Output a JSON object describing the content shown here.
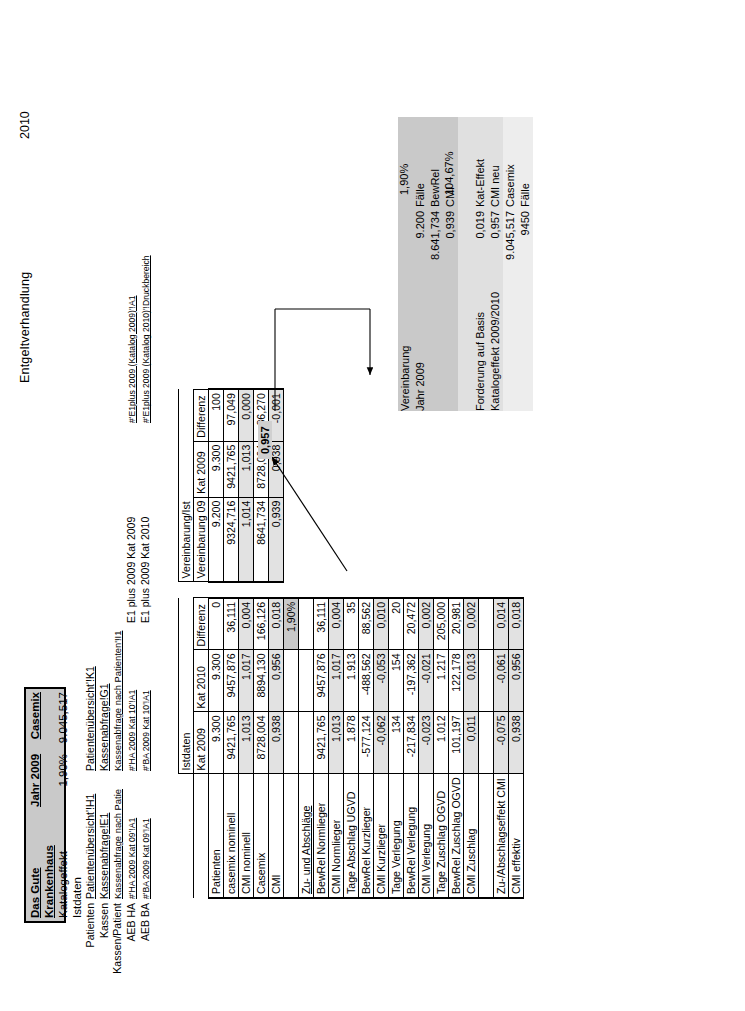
{
  "document": {
    "title": "Entgeltverhandlung",
    "year": "2010"
  },
  "header_box": {
    "hospital": "Das Gute Krankenhaus",
    "col2_title": "Jahr 2009",
    "col3_title": "Casemix",
    "row_label": "Katalogeffekt Istdaten",
    "percent": "1,90%",
    "casemix": "9.045,517"
  },
  "links": {
    "rows": [
      {
        "label": "Patienten",
        "a": "Patientenübersicht'!H1",
        "b": "Patientenübersicht'!K1",
        "c": ""
      },
      {
        "label": "Kassen",
        "a": "Kassenabfrage!E1",
        "b": "Kassenabfrage!G1",
        "c": ""
      },
      {
        "label": "Kassen/Patient",
        "a": "Kassenabfrage nach Patie",
        "b": "Kassenabfrage nach Patienten'!I1",
        "c": ""
      },
      {
        "label": "AEB HA",
        "a": "#'HA 2009 Kat 09'!A1",
        "b": "#'HA 2009 Kat 10'!A1",
        "c": "E1 plus 2009 Kat 2009",
        "d": "#'E1plus 2009 (Katalog 2009)'!A1"
      },
      {
        "label": "AEB BA",
        "a": "#'BA 2009 Kat 09'!A1",
        "b": "#'BA 2009 Kat 10'!A1",
        "c": "E1 plus 2009 Kat 2010",
        "d": "#'E1plus 2009 (Katalog 2010)'!Druckbereich"
      }
    ]
  },
  "table": {
    "group_headers": {
      "istdaten": "Istdaten",
      "vereinbarung_ist": "Vereinbarung/Ist"
    },
    "columns": [
      "",
      "Kat 2009",
      "Kat 2010",
      "Differenz",
      "Vereinbarung 09",
      "Kat 2009",
      "Differenz"
    ],
    "rows": [
      {
        "label": "Patienten",
        "kat2009": "9.300",
        "kat2010": "9.300",
        "differenz": "0",
        "vereinbarung09": "9.200",
        "v_kat2009": "9.300",
        "v_differenz": "100",
        "shade": false
      },
      {
        "label": "casemix nominell",
        "kat2009": "9421,765",
        "kat2010": "9457,876",
        "differenz": "36,111",
        "vereinbarung09": "9324,716",
        "v_kat2009": "9421,765",
        "v_differenz": "97,049",
        "shade": false
      },
      {
        "label": "CMI nominell",
        "kat2009": "1,013",
        "kat2010": "1,017",
        "differenz": "0,004",
        "vereinbarung09": "1,014",
        "v_kat2009": "1,013",
        "v_differenz": "0,000",
        "shade": true
      },
      {
        "label": "Casemix",
        "kat2009": "8728,004",
        "kat2010": "8894,130",
        "differenz": "166,126",
        "vereinbarung09": "8641,734",
        "v_kat2009": "8728,004",
        "v_differenz": "86,270",
        "shade": false
      },
      {
        "label": "CMI",
        "kat2009": "0,938",
        "kat2010": "0,956",
        "differenz": "0,018",
        "vereinbarung09": "0,939",
        "v_kat2009": "0,938",
        "v_differenz": "-0,001",
        "shade": true
      },
      {
        "label": "",
        "kat2009": "",
        "kat2010": "",
        "differenz": "1,90%",
        "vereinbarung09": "",
        "v_kat2009": "",
        "v_differenz": "",
        "shade": false,
        "diffShade": true,
        "diffBold": true
      },
      {
        "label": "Zu- und Abschläge",
        "kat2009": "",
        "kat2010": "",
        "differenz": "",
        "vereinbarung09": "",
        "v_kat2009": "",
        "v_differenz": "",
        "section": true
      },
      {
        "label": "BewRel Normlieger",
        "kat2009": "9421,765",
        "kat2010": "9457,876",
        "differenz": "36,111",
        "vereinbarung09": "",
        "v_kat2009": "",
        "v_differenz": "",
        "shade": false
      },
      {
        "label": "CMI Normlieger",
        "kat2009": "1,013",
        "kat2010": "1,017",
        "differenz": "0,004",
        "vereinbarung09": "",
        "v_kat2009": "",
        "v_differenz": "",
        "shade": true
      },
      {
        "label": "Tage Abschlag UGVD",
        "kat2009": "1.878",
        "kat2010": "1.913",
        "differenz": "35",
        "vereinbarung09": "",
        "v_kat2009": "",
        "v_differenz": "",
        "shade": false
      },
      {
        "label": "BewRel Kurzlieger",
        "kat2009": "-577,124",
        "kat2010": "-488,562",
        "differenz": "88,562",
        "vereinbarung09": "",
        "v_kat2009": "",
        "v_differenz": "",
        "shade": false
      },
      {
        "label": "CMI Kurzlieger",
        "kat2009": "-0,062",
        "kat2010": "-0,053",
        "differenz": "0,010",
        "vereinbarung09": "",
        "v_kat2009": "",
        "v_differenz": "",
        "shade": true
      },
      {
        "label": "Tage Verlegung",
        "kat2009": "134",
        "kat2010": "154",
        "differenz": "20",
        "vereinbarung09": "",
        "v_kat2009": "",
        "v_differenz": "",
        "shade": false
      },
      {
        "label": "BewRel Verlegung",
        "kat2009": "-217,834",
        "kat2010": "-197,362",
        "differenz": "20,472",
        "vereinbarung09": "",
        "v_kat2009": "",
        "v_differenz": "",
        "shade": false
      },
      {
        "label": "CMI Verlegung",
        "kat2009": "-0,023",
        "kat2010": "-0,021",
        "differenz": "0,002",
        "vereinbarung09": "",
        "v_kat2009": "",
        "v_differenz": "",
        "shade": true
      },
      {
        "label": "Tage Zuschlag OGVD",
        "kat2009": "1.012",
        "kat2010": "1.217",
        "differenz": "205,000",
        "vereinbarung09": "",
        "v_kat2009": "",
        "v_differenz": "",
        "shade": false
      },
      {
        "label": "BewRel Zuschlag OGVD",
        "kat2009": "101,197",
        "kat2010": "122,178",
        "differenz": "20,981",
        "vereinbarung09": "",
        "v_kat2009": "",
        "v_differenz": "",
        "shade": false
      },
      {
        "label": "CMI Zuschlag",
        "kat2009": "0,011",
        "kat2010": "0,013",
        "differenz": "0,002",
        "vereinbarung09": "",
        "v_kat2009": "",
        "v_differenz": "",
        "shade": true
      },
      {
        "label": "",
        "kat2009": "",
        "kat2010": "",
        "differenz": "",
        "vereinbarung09": "",
        "v_kat2009": "",
        "v_differenz": "",
        "shade": false
      },
      {
        "label": "Zu-/Abschlagseffekt CMI",
        "kat2009": "-0,075",
        "kat2010": "-0,061",
        "differenz": "0,014",
        "vereinbarung09": "",
        "v_kat2009": "",
        "v_differenz": "",
        "shade": true
      },
      {
        "label": "CMI effektiv",
        "kat2009": "0,938",
        "kat2010": "0,956",
        "differenz": "0,018",
        "vereinbarung09": "",
        "v_kat2009": "",
        "v_differenz": "",
        "shade": true
      }
    ]
  },
  "callout": {
    "value": "0,957"
  },
  "summary": {
    "rows": [
      {
        "label": "Vereinbarung",
        "value": "",
        "unit": "",
        "bg": "bg1"
      },
      {
        "label": "Jahr 2009",
        "value": "9.200",
        "unit": "Fälle",
        "bg": "bg1"
      },
      {
        "label": "",
        "value": "8.641,734",
        "unit": "BewRel",
        "bg": "bg1"
      },
      {
        "label": "",
        "value": "0,939",
        "unit": "CMI",
        "bg": "bg1"
      },
      {
        "label": "",
        "value": "",
        "unit": "",
        "bg": "bg2"
      },
      {
        "label": "Forderung auf Basis",
        "value": "0,019",
        "unit": "Kat-Effekt",
        "bg": "bg2"
      },
      {
        "label": "Katalogeffekt 2009/2010",
        "value": "0,957",
        "unit": "CMI neu",
        "bg": "bg2"
      },
      {
        "label": "",
        "value": "9.045,517",
        "unit": "Casemix",
        "bg": "bg3"
      },
      {
        "label": "",
        "value": "9450",
        "unit": "Fälle",
        "bg": "bg3"
      }
    ],
    "annotations": {
      "pct": "1,90%",
      "pct2": "104,67%"
    }
  }
}
